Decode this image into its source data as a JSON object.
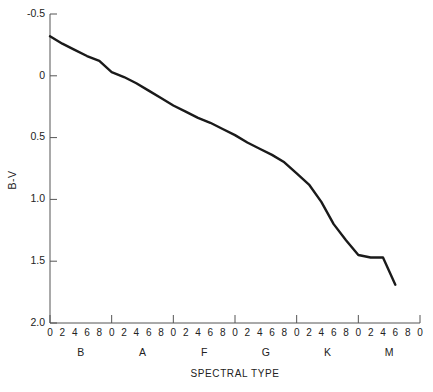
{
  "chart_data": {
    "type": "line",
    "title": "",
    "xlabel": "SPECTRAL TYPE",
    "ylabel": "B-V",
    "ylim": [
      -0.5,
      2.0
    ],
    "y_inverted": true,
    "grid": false,
    "legend": null,
    "y_ticks": [
      "-0.5",
      "0",
      "0.5",
      "1.0",
      "1.5",
      "2.0"
    ],
    "y_tick_values": [
      -0.5,
      0,
      0.5,
      1.0,
      1.5,
      2.0
    ],
    "x_classes": [
      "B",
      "A",
      "F",
      "G",
      "K",
      "M"
    ],
    "x_subtick_labels": [
      "0",
      "2",
      "4",
      "6",
      "8"
    ],
    "x_end_label": "0",
    "x": [
      0,
      1,
      2,
      3,
      4,
      5,
      6,
      7,
      8,
      9,
      10,
      11,
      12,
      13,
      14,
      15,
      16,
      17,
      18,
      19,
      20,
      21,
      22,
      23,
      24,
      25,
      26,
      27,
      28
    ],
    "x_spectral": [
      "B0",
      "B2",
      "B4",
      "B6",
      "B8",
      "A0",
      "A2",
      "A4",
      "A6",
      "A8",
      "F0",
      "F2",
      "F4",
      "F6",
      "F8",
      "G0",
      "G2",
      "G4",
      "G6",
      "G8",
      "K0",
      "K2",
      "K4",
      "K6",
      "K8",
      "M0",
      "M2",
      "M4",
      "M6"
    ],
    "values": [
      -0.32,
      -0.26,
      -0.21,
      -0.16,
      -0.12,
      -0.03,
      0.01,
      0.06,
      0.12,
      0.18,
      0.24,
      0.29,
      0.34,
      0.38,
      0.43,
      0.48,
      0.54,
      0.59,
      0.64,
      0.7,
      0.79,
      0.88,
      1.02,
      1.2,
      1.33,
      1.45,
      1.47,
      1.47,
      1.69
    ],
    "line_color": "#1a1a1a",
    "axis_color": "#555555"
  },
  "axis": {
    "y_title": "B-V",
    "x_title": "SPECTRAL TYPE"
  }
}
